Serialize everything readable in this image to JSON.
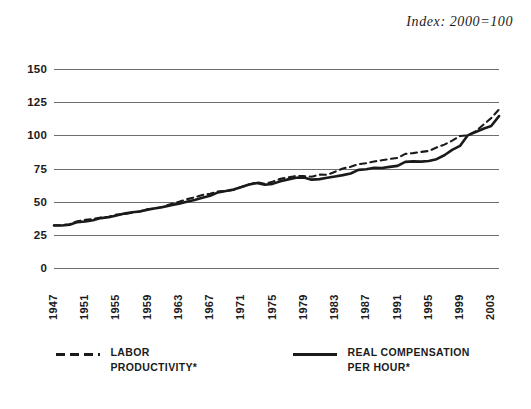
{
  "figure": {
    "subtitle": "Index: 2000=100"
  },
  "legend": [
    {
      "name": "labor-productivity",
      "label": "LABOR PRODUCTIVITY*",
      "style": "dashed"
    },
    {
      "name": "real-compensation-per-hour",
      "label": "REAL COMPENSATION PER HOUR*",
      "style": "solid"
    }
  ],
  "chart_data": {
    "type": "line",
    "title": "",
    "subtitle": "Index: 2000=100",
    "xlabel": "",
    "ylabel": "",
    "xlim": [
      1947,
      2004
    ],
    "ylim": [
      0,
      150
    ],
    "yticks": [
      150,
      125,
      100,
      75,
      50,
      25,
      0
    ],
    "ytick_labels": [
      "150",
      "125",
      "100",
      "75",
      "50",
      "25",
      "0"
    ],
    "xticks": [
      1947,
      1951,
      1955,
      1959,
      1963,
      1967,
      1971,
      1975,
      1979,
      1983,
      1987,
      1991,
      1995,
      1999,
      2003
    ],
    "xtick_labels": [
      "1947",
      "1951",
      "1955",
      "1959",
      "1963",
      "1967",
      "1971",
      "1975",
      "1979",
      "1983",
      "1987",
      "1991",
      "1995",
      "1999",
      "2003"
    ],
    "grid": "horizontal",
    "legend_position": "bottom",
    "x": [
      1947,
      1948,
      1949,
      1950,
      1951,
      1952,
      1953,
      1954,
      1955,
      1956,
      1957,
      1958,
      1959,
      1960,
      1961,
      1962,
      1963,
      1964,
      1965,
      1966,
      1967,
      1968,
      1969,
      1970,
      1971,
      1972,
      1973,
      1974,
      1975,
      1976,
      1977,
      1978,
      1979,
      1980,
      1981,
      1982,
      1983,
      1984,
      1985,
      1986,
      1987,
      1988,
      1989,
      1990,
      1991,
      1992,
      1993,
      1994,
      1995,
      1996,
      1997,
      1998,
      1999,
      2000,
      2001,
      2002,
      2003,
      2004
    ],
    "series": [
      {
        "name": "LABOR PRODUCTIVITY*",
        "style": "dashed",
        "color": "#1a1a1a",
        "values": [
          32.2,
          32.3,
          33.0,
          35.3,
          36.3,
          37.0,
          38.0,
          38.6,
          40.3,
          40.6,
          41.7,
          42.7,
          44.3,
          44.8,
          46.3,
          48.2,
          49.9,
          51.8,
          53.3,
          55.0,
          56.0,
          57.7,
          58.0,
          58.8,
          61.0,
          63.0,
          64.6,
          63.4,
          65.0,
          67.2,
          68.3,
          69.4,
          69.3,
          68.8,
          70.4,
          70.2,
          72.6,
          75.0,
          76.3,
          78.3,
          79.0,
          80.3,
          81.2,
          82.2,
          83.0,
          86.0,
          86.6,
          87.5,
          88.2,
          90.8,
          93.0,
          96.0,
          99.5,
          100.0,
          103.0,
          108.0,
          113.0,
          119.5
        ]
      },
      {
        "name": "REAL COMPENSATION PER HOUR*",
        "style": "solid",
        "color": "#1a1a1a",
        "values": [
          32.0,
          32.0,
          32.6,
          34.6,
          35.0,
          36.0,
          37.6,
          38.2,
          39.6,
          41.0,
          42.0,
          42.6,
          44.0,
          45.0,
          46.0,
          47.4,
          48.4,
          50.0,
          51.2,
          53.0,
          54.4,
          57.0,
          58.0,
          59.2,
          61.0,
          63.0,
          64.0,
          62.8,
          63.4,
          65.4,
          66.8,
          68.0,
          68.2,
          66.6,
          67.0,
          68.0,
          69.0,
          70.0,
          71.2,
          74.0,
          74.4,
          75.6,
          75.4,
          76.2,
          77.0,
          80.0,
          80.4,
          80.2,
          80.6,
          82.0,
          85.0,
          89.0,
          92.0,
          100.0,
          102.5,
          105.0,
          107.0,
          114.5
        ]
      }
    ]
  }
}
